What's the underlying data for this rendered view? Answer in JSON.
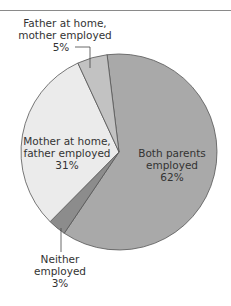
{
  "chart_data": {
    "type": "pie",
    "title": "",
    "categories": [
      "Both parents employed",
      "Neither employed",
      "Mother at home, father employed",
      "Father at home, mother employed"
    ],
    "values": [
      62,
      3,
      31,
      5
    ],
    "colors": [
      "#a9a9a9",
      "#8c8c8c",
      "#ebebeb",
      "#c2c2c2"
    ],
    "start_angle_deg": -7,
    "direction": "clockwise",
    "unit": "%"
  },
  "labels": {
    "both": {
      "line1": "Both parents",
      "line2": "employed",
      "pct": "62%"
    },
    "neither": {
      "line1": "Neither",
      "line2": "employed",
      "pct": "3%"
    },
    "mother_home": {
      "line1": "Mother at home,",
      "line2": "father employed",
      "pct": "31%"
    },
    "father_home": {
      "line1": "Father at home,",
      "line2": "mother employed",
      "pct": "5%"
    }
  }
}
